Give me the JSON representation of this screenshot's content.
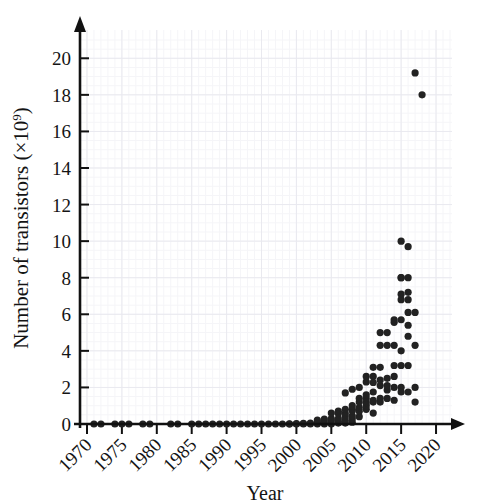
{
  "chart_data": {
    "type": "scatter",
    "title": "",
    "xlabel": "Year",
    "ylabel": "Number of transistors (×10⁹)",
    "ylabel_base": "Number of transistors (×10",
    "ylabel_exponent": "9",
    "ylabel_close": ")",
    "xlim": [
      1969,
      2022
    ],
    "ylim": [
      0,
      21
    ],
    "xticks": [
      1970,
      1975,
      1980,
      1985,
      1990,
      1995,
      2000,
      2005,
      2010,
      2015,
      2020
    ],
    "xtick_labels": [
      "1970",
      "1975",
      "1980",
      "1985",
      "1990",
      "1995",
      "2000",
      "2005",
      "2010",
      "2015",
      "2020"
    ],
    "yticks": [
      0,
      2,
      4,
      6,
      8,
      10,
      12,
      14,
      16,
      18,
      20
    ],
    "ytick_labels": [
      "0",
      "2",
      "4",
      "6",
      "8",
      "10",
      "12",
      "14",
      "16",
      "18",
      "20"
    ],
    "grid": true,
    "grid_minor": true,
    "grid_color": "#e9e9ef",
    "marker_color": "#222222",
    "marker_size": 6,
    "xtick_rotation": -45,
    "legend": null,
    "points": [
      [
        1971,
        0.0
      ],
      [
        1972,
        0.0
      ],
      [
        1974,
        0.0
      ],
      [
        1975,
        0.0
      ],
      [
        1976,
        0.0
      ],
      [
        1978,
        0.0
      ],
      [
        1979,
        0.0
      ],
      [
        1982,
        0.0
      ],
      [
        1983,
        0.0
      ],
      [
        1985,
        0.0
      ],
      [
        1986,
        0.0
      ],
      [
        1987,
        0.0
      ],
      [
        1988,
        0.0
      ],
      [
        1989,
        0.0
      ],
      [
        1990,
        0.0
      ],
      [
        1991,
        0.0
      ],
      [
        1992,
        0.0
      ],
      [
        1993,
        0.0
      ],
      [
        1994,
        0.0
      ],
      [
        1995,
        0.0
      ],
      [
        1996,
        0.0
      ],
      [
        1997,
        0.0
      ],
      [
        1998,
        0.0
      ],
      [
        1999,
        0.0
      ],
      [
        1999,
        0.01
      ],
      [
        2000,
        0.0
      ],
      [
        2000,
        0.02
      ],
      [
        2001,
        0.0
      ],
      [
        2001,
        0.03
      ],
      [
        2002,
        0.0
      ],
      [
        2002,
        0.05
      ],
      [
        2003,
        0.0
      ],
      [
        2003,
        0.1
      ],
      [
        2003,
        0.22
      ],
      [
        2004,
        0.0
      ],
      [
        2004,
        0.12
      ],
      [
        2004,
        0.27
      ],
      [
        2005,
        0.0
      ],
      [
        2005,
        0.17
      ],
      [
        2005,
        0.29
      ],
      [
        2005,
        0.6
      ],
      [
        2006,
        0.05
      ],
      [
        2006,
        0.15
      ],
      [
        2006,
        0.3
      ],
      [
        2006,
        0.58
      ],
      [
        2006,
        0.7
      ],
      [
        2007,
        0.05
      ],
      [
        2007,
        0.2
      ],
      [
        2007,
        0.4
      ],
      [
        2007,
        0.58
      ],
      [
        2007,
        0.8
      ],
      [
        2007,
        1.7
      ],
      [
        2008,
        0.1
      ],
      [
        2008,
        0.3
      ],
      [
        2008,
        0.45
      ],
      [
        2008,
        0.73
      ],
      [
        2008,
        0.8
      ],
      [
        2008,
        1.0
      ],
      [
        2008,
        1.9
      ],
      [
        2009,
        0.4
      ],
      [
        2009,
        0.7
      ],
      [
        2009,
        0.9
      ],
      [
        2009,
        1.2
      ],
      [
        2009,
        1.4
      ],
      [
        2009,
        2.0
      ],
      [
        2010,
        0.8
      ],
      [
        2010,
        1.0
      ],
      [
        2010,
        1.17
      ],
      [
        2010,
        1.4
      ],
      [
        2010,
        1.6
      ],
      [
        2010,
        2.3
      ],
      [
        2010,
        2.6
      ],
      [
        2011,
        0.6
      ],
      [
        2011,
        1.2
      ],
      [
        2011,
        1.3
      ],
      [
        2011,
        1.75
      ],
      [
        2011,
        2.27
      ],
      [
        2011,
        2.6
      ],
      [
        2011,
        3.1
      ],
      [
        2012,
        1.2
      ],
      [
        2012,
        1.4
      ],
      [
        2012,
        2.1
      ],
      [
        2012,
        2.4
      ],
      [
        2012,
        3.1
      ],
      [
        2012,
        4.3
      ],
      [
        2012,
        5.0
      ],
      [
        2013,
        1.4
      ],
      [
        2013,
        1.86
      ],
      [
        2013,
        2.1
      ],
      [
        2013,
        2.5
      ],
      [
        2013,
        4.3
      ],
      [
        2013,
        5.0
      ],
      [
        2014,
        1.3
      ],
      [
        2014,
        2.0
      ],
      [
        2014,
        2.6
      ],
      [
        2014,
        3.2
      ],
      [
        2014,
        4.3
      ],
      [
        2014,
        5.56
      ],
      [
        2014,
        5.7
      ],
      [
        2015,
        1.75
      ],
      [
        2015,
        2.0
      ],
      [
        2015,
        3.2
      ],
      [
        2015,
        4.0
      ],
      [
        2015,
        5.7
      ],
      [
        2015,
        6.8
      ],
      [
        2015,
        7.1
      ],
      [
        2015,
        8.0
      ],
      [
        2015,
        8.0
      ],
      [
        2015,
        10.0
      ],
      [
        2016,
        1.75
      ],
      [
        2016,
        3.2
      ],
      [
        2016,
        4.8
      ],
      [
        2016,
        5.4
      ],
      [
        2016,
        6.1
      ],
      [
        2016,
        6.8
      ],
      [
        2016,
        7.2
      ],
      [
        2016,
        8.0
      ],
      [
        2016,
        9.7
      ],
      [
        2017,
        1.2
      ],
      [
        2017,
        2.0
      ],
      [
        2017,
        4.3
      ],
      [
        2017,
        6.1
      ],
      [
        2017,
        19.2
      ],
      [
        2018,
        18.0
      ]
    ]
  }
}
